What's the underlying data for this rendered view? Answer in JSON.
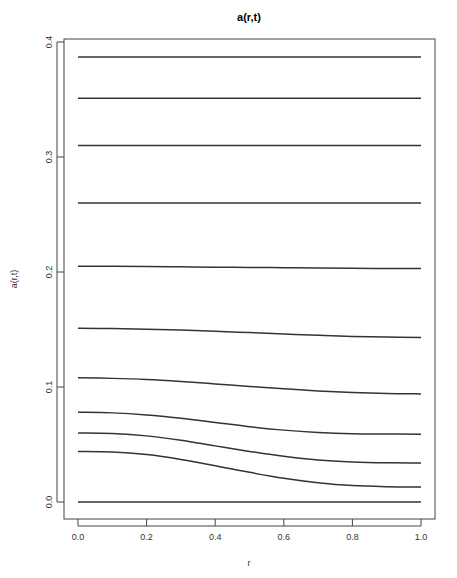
{
  "chart_data": {
    "type": "line",
    "title": "a(r,t)",
    "xlabel": "r",
    "ylabel": "a(r,t)",
    "xlim": [
      0.0,
      1.0
    ],
    "ylim": [
      0.0,
      0.4
    ],
    "xticks": [
      "0.0",
      "0.2",
      "0.4",
      "0.6",
      "0.8",
      "1.0"
    ],
    "yticks": [
      "0.0",
      "0.1",
      "0.2",
      "0.3",
      "0.4"
    ],
    "grid": false,
    "legend": null,
    "line_color": "#333333",
    "x": [
      0.0,
      0.1,
      0.2,
      0.3,
      0.4,
      0.5,
      0.6,
      0.7,
      0.8,
      0.9,
      1.0
    ],
    "series": [
      {
        "name": "t1",
        "values": [
          0.387,
          0.387,
          0.387,
          0.387,
          0.387,
          0.387,
          0.387,
          0.387,
          0.387,
          0.387,
          0.387
        ]
      },
      {
        "name": "t2",
        "values": [
          0.351,
          0.351,
          0.351,
          0.351,
          0.351,
          0.351,
          0.351,
          0.351,
          0.351,
          0.351,
          0.351
        ]
      },
      {
        "name": "t3",
        "values": [
          0.31,
          0.31,
          0.31,
          0.31,
          0.31,
          0.31,
          0.31,
          0.31,
          0.31,
          0.31,
          0.31
        ]
      },
      {
        "name": "t4",
        "values": [
          0.26,
          0.26,
          0.26,
          0.26,
          0.26,
          0.26,
          0.26,
          0.26,
          0.26,
          0.26,
          0.26
        ]
      },
      {
        "name": "t5",
        "values": [
          0.205,
          0.205,
          0.2048,
          0.2045,
          0.2042,
          0.204,
          0.2037,
          0.2034,
          0.2032,
          0.2031,
          0.203
        ]
      },
      {
        "name": "t6",
        "values": [
          0.151,
          0.1508,
          0.1503,
          0.1495,
          0.1485,
          0.1473,
          0.1461,
          0.1449,
          0.144,
          0.1434,
          0.143
        ]
      },
      {
        "name": "t7",
        "values": [
          0.108,
          0.1075,
          0.1065,
          0.1048,
          0.1027,
          0.1005,
          0.0985,
          0.0966,
          0.0952,
          0.0943,
          0.094
        ]
      },
      {
        "name": "t8",
        "values": [
          0.078,
          0.0775,
          0.0757,
          0.0728,
          0.0692,
          0.0655,
          0.0625,
          0.0605,
          0.0594,
          0.0591,
          0.059
        ]
      },
      {
        "name": "t9",
        "values": [
          0.06,
          0.0595,
          0.0575,
          0.0537,
          0.0488,
          0.044,
          0.0397,
          0.0365,
          0.0348,
          0.0341,
          0.034
        ]
      },
      {
        "name": "t10",
        "values": [
          0.044,
          0.0435,
          0.0412,
          0.037,
          0.0315,
          0.0258,
          0.0207,
          0.0168,
          0.0143,
          0.0133,
          0.013
        ]
      },
      {
        "name": "t11",
        "values": [
          0.0,
          0.0,
          0.0,
          0.0,
          0.0,
          0.0,
          0.0,
          0.0,
          0.0,
          0.0,
          0.0
        ]
      }
    ]
  }
}
